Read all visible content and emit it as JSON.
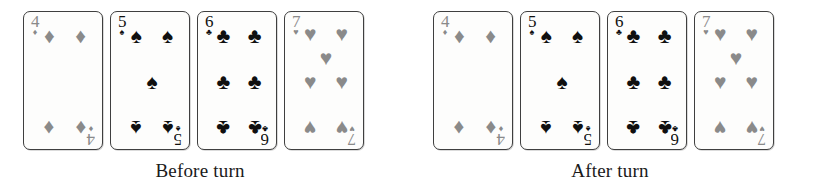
{
  "figure": {
    "suit_glyphs": {
      "diamond": "♦",
      "spade": "♠",
      "club": "♣",
      "heart": "♥"
    },
    "panels": [
      {
        "id": "before",
        "caption": "Before turn",
        "cards": [
          {
            "rank": "4",
            "suit": "diamond",
            "suit_symbol": "♦",
            "color_class": "red",
            "color": "#8a8a8a",
            "pip_count": 4,
            "pip_layout": [
              {
                "x": 22,
                "y": 12,
                "flip": false
              },
              {
                "x": 78,
                "y": 12,
                "flip": false
              },
              {
                "x": 22,
                "y": 88,
                "flip": true
              },
              {
                "x": 78,
                "y": 88,
                "flip": true
              }
            ]
          },
          {
            "rank": "5",
            "suit": "spade",
            "suit_symbol": "♠",
            "color_class": "black",
            "color": "#101010",
            "pip_count": 5,
            "pip_layout": [
              {
                "x": 22,
                "y": 12,
                "flip": false
              },
              {
                "x": 78,
                "y": 12,
                "flip": false
              },
              {
                "x": 50,
                "y": 50,
                "flip": false
              },
              {
                "x": 22,
                "y": 88,
                "flip": true
              },
              {
                "x": 78,
                "y": 88,
                "flip": true
              }
            ]
          },
          {
            "rank": "6",
            "suit": "club",
            "suit_symbol": "♣",
            "color_class": "black",
            "color": "#101010",
            "pip_count": 6,
            "pip_layout": [
              {
                "x": 22,
                "y": 12,
                "flip": false
              },
              {
                "x": 78,
                "y": 12,
                "flip": false
              },
              {
                "x": 22,
                "y": 50,
                "flip": false
              },
              {
                "x": 78,
                "y": 50,
                "flip": false
              },
              {
                "x": 22,
                "y": 88,
                "flip": true
              },
              {
                "x": 78,
                "y": 88,
                "flip": true
              }
            ]
          },
          {
            "rank": "7",
            "suit": "heart",
            "suit_symbol": "♥",
            "color_class": "red",
            "color": "#8a8a8a",
            "pip_count": 7,
            "pip_layout": [
              {
                "x": 22,
                "y": 10,
                "flip": false
              },
              {
                "x": 78,
                "y": 10,
                "flip": false
              },
              {
                "x": 50,
                "y": 30,
                "flip": false
              },
              {
                "x": 22,
                "y": 50,
                "flip": false
              },
              {
                "x": 78,
                "y": 50,
                "flip": false
              },
              {
                "x": 22,
                "y": 88,
                "flip": true
              },
              {
                "x": 78,
                "y": 88,
                "flip": true
              }
            ]
          }
        ]
      },
      {
        "id": "after",
        "caption": "After turn",
        "cards": [
          {
            "rank": "4",
            "suit": "diamond",
            "suit_symbol": "♦",
            "color_class": "red",
            "color": "#8a8a8a",
            "pip_count": 4,
            "pip_layout": [
              {
                "x": 22,
                "y": 12,
                "flip": false
              },
              {
                "x": 78,
                "y": 12,
                "flip": false
              },
              {
                "x": 22,
                "y": 88,
                "flip": true
              },
              {
                "x": 78,
                "y": 88,
                "flip": true
              }
            ]
          },
          {
            "rank": "5",
            "suit": "spade",
            "suit_symbol": "♠",
            "color_class": "black",
            "color": "#101010",
            "pip_count": 5,
            "pip_layout": [
              {
                "x": 22,
                "y": 12,
                "flip": false
              },
              {
                "x": 78,
                "y": 12,
                "flip": false
              },
              {
                "x": 50,
                "y": 50,
                "flip": false
              },
              {
                "x": 22,
                "y": 88,
                "flip": true
              },
              {
                "x": 78,
                "y": 88,
                "flip": true
              }
            ]
          },
          {
            "rank": "6",
            "suit": "club",
            "suit_symbol": "♣",
            "color_class": "black",
            "color": "#101010",
            "pip_count": 6,
            "pip_layout": [
              {
                "x": 22,
                "y": 12,
                "flip": false
              },
              {
                "x": 78,
                "y": 12,
                "flip": false
              },
              {
                "x": 22,
                "y": 50,
                "flip": false
              },
              {
                "x": 78,
                "y": 50,
                "flip": false
              },
              {
                "x": 22,
                "y": 88,
                "flip": true
              },
              {
                "x": 78,
                "y": 88,
                "flip": true
              }
            ]
          },
          {
            "rank": "7",
            "suit": "heart",
            "suit_symbol": "♥",
            "color_class": "red",
            "color": "#8a8a8a",
            "pip_count": 7,
            "pip_layout": [
              {
                "x": 22,
                "y": 10,
                "flip": false
              },
              {
                "x": 78,
                "y": 10,
                "flip": false
              },
              {
                "x": 50,
                "y": 30,
                "flip": false
              },
              {
                "x": 22,
                "y": 50,
                "flip": false
              },
              {
                "x": 78,
                "y": 50,
                "flip": false
              },
              {
                "x": 22,
                "y": 88,
                "flip": true
              },
              {
                "x": 78,
                "y": 88,
                "flip": true
              }
            ]
          }
        ]
      }
    ]
  }
}
